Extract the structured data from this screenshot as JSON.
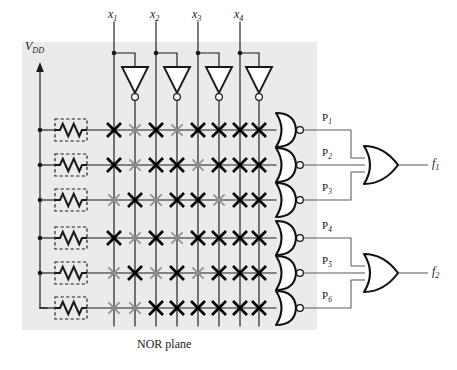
{
  "figure": {
    "caption": "NOR plane",
    "supply_label": "V",
    "supply_sub": "DD",
    "background_color": "#eceaea",
    "line_color": "#1a1a1a",
    "programmed_color": "#000000",
    "unprogrammed_color": "#8f8f8f"
  },
  "inputs": [
    {
      "label": "x",
      "sub": "1"
    },
    {
      "label": "x",
      "sub": "2"
    },
    {
      "label": "x",
      "sub": "3"
    },
    {
      "label": "x",
      "sub": "4"
    }
  ],
  "inverters": [
    {
      "name": "inverter-x1"
    },
    {
      "name": "inverter-x2"
    },
    {
      "name": "inverter-x3"
    },
    {
      "name": "inverter-x4"
    }
  ],
  "columns": [
    {
      "id": "x1",
      "x": 114
    },
    {
      "id": "x1n",
      "x": 135
    },
    {
      "id": "x2",
      "x": 156
    },
    {
      "id": "x2n",
      "x": 177
    },
    {
      "id": "x3",
      "x": 198
    },
    {
      "id": "x3n",
      "x": 219
    },
    {
      "id": "x4",
      "x": 240
    },
    {
      "id": "x4n",
      "x": 259
    }
  ],
  "product_terms": [
    {
      "label": "P",
      "sub": "1",
      "y": 130,
      "connections": [
        1,
        0,
        1,
        0,
        1,
        1,
        1,
        1
      ]
    },
    {
      "label": "P",
      "sub": "2",
      "y": 165,
      "connections": [
        1,
        0,
        1,
        1,
        0,
        1,
        1,
        1
      ]
    },
    {
      "label": "P",
      "sub": "3",
      "y": 200,
      "connections": [
        0,
        1,
        0,
        1,
        1,
        0,
        1,
        1
      ]
    },
    {
      "label": "P",
      "sub": "4",
      "y": 238,
      "connections": [
        1,
        0,
        1,
        0,
        1,
        1,
        1,
        1
      ]
    },
    {
      "label": "P",
      "sub": "5",
      "y": 273,
      "connections": [
        0,
        1,
        0,
        1,
        0,
        1,
        1,
        1
      ]
    },
    {
      "label": "P",
      "sub": "6",
      "y": 308,
      "connections": [
        0,
        0,
        1,
        1,
        1,
        1,
        1,
        1
      ]
    }
  ],
  "pullup_resistors": [
    {
      "name": "pullup-resistor-1"
    },
    {
      "name": "pullup-resistor-2"
    },
    {
      "name": "pullup-resistor-3"
    },
    {
      "name": "pullup-resistor-4"
    },
    {
      "name": "pullup-resistor-5"
    },
    {
      "name": "pullup-resistor-6"
    }
  ],
  "outputs": [
    {
      "label": "f",
      "sub": "1",
      "inputs": [
        "P1",
        "P2",
        "P3"
      ]
    },
    {
      "label": "f",
      "sub": "2",
      "inputs": [
        "P4",
        "P5",
        "P6"
      ]
    }
  ],
  "chart_data": {
    "type": "diagram",
    "matrix_legend": {
      "1": "programmed (dark X)",
      "0": "not programmed (gray X)"
    },
    "column_ids": [
      "x1",
      "x1'",
      "x2",
      "x2'",
      "x3",
      "x3'",
      "x4",
      "x4'"
    ],
    "row_ids": [
      "P1",
      "P2",
      "P3",
      "P4",
      "P5",
      "P6"
    ],
    "matrix": [
      [
        1,
        0,
        1,
        0,
        1,
        1,
        1,
        1
      ],
      [
        1,
        0,
        1,
        1,
        0,
        1,
        1,
        1
      ],
      [
        0,
        1,
        0,
        1,
        1,
        0,
        1,
        1
      ],
      [
        1,
        0,
        1,
        0,
        1,
        1,
        1,
        1
      ],
      [
        0,
        1,
        0,
        1,
        0,
        1,
        1,
        1
      ],
      [
        0,
        0,
        1,
        1,
        1,
        1,
        1,
        1
      ]
    ]
  }
}
